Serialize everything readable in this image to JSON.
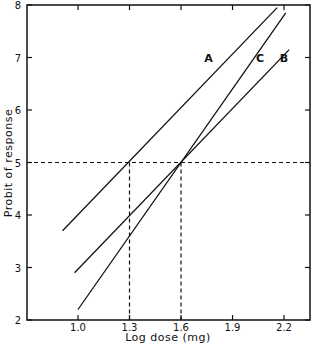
{
  "chart_data": {
    "type": "line",
    "title": "",
    "xlabel": "Log dose (mg)",
    "ylabel": "Probit of response",
    "xlim": [
      0.7,
      2.35
    ],
    "ylim": [
      2,
      8
    ],
    "x_ticks": [
      "1.0",
      "1.3",
      "1.6",
      "1.9",
      "2.2"
    ],
    "y_ticks": [
      "2",
      "3",
      "4",
      "5",
      "6",
      "7",
      "8"
    ],
    "grid": false,
    "legend": "inline labels",
    "series": [
      {
        "name": "A",
        "x": [
          0.91,
          2.16
        ],
        "y": [
          3.7,
          7.95
        ]
      },
      {
        "name": "B",
        "x": [
          0.98,
          2.23
        ],
        "y": [
          2.9,
          7.15
        ]
      },
      {
        "name": "C",
        "x": [
          1.0,
          2.21
        ],
        "y": [
          2.2,
          7.85
        ]
      }
    ],
    "reference_lines": [
      {
        "type": "horizontal",
        "y": 5,
        "style": "dashed"
      },
      {
        "type": "vertical",
        "x": 1.3,
        "y_to": 5,
        "style": "dashed"
      },
      {
        "type": "vertical",
        "x": 1.6,
        "y_to": 5,
        "style": "dashed"
      }
    ],
    "annotations": [
      {
        "text": "A",
        "x": 1.76,
        "y": 7.0
      },
      {
        "text": "C",
        "x": 2.06,
        "y": 7.0
      },
      {
        "text": "B",
        "x": 2.2,
        "y": 7.0
      }
    ]
  }
}
